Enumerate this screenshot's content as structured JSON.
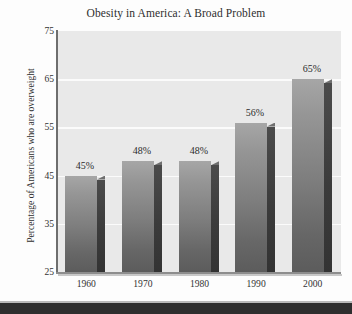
{
  "chart_data": {
    "type": "bar",
    "title": "Obesity in America: A Broad Problem",
    "xlabel": "",
    "ylabel": "Percentage of Americans who are overweight",
    "categories": [
      "1960",
      "1970",
      "1980",
      "1990",
      "2000"
    ],
    "values": [
      45,
      48,
      48,
      56,
      65
    ],
    "data_labels": [
      "45%",
      "48%",
      "48%",
      "56%",
      "65%"
    ],
    "ylim": [
      25,
      75
    ],
    "yticks": [
      75,
      65,
      55,
      45,
      35,
      25
    ],
    "ytick_labels": [
      "75",
      "65",
      "55",
      "45",
      "35",
      "25"
    ],
    "grid": true,
    "legend": false,
    "legend_position": "none",
    "series": [
      {
        "name": "Percentage overweight",
        "values": [
          45,
          48,
          48,
          56,
          65
        ]
      }
    ],
    "style": {
      "bar_color": "#7e7e7e",
      "bar_side_color": "#3b3b3b",
      "plot_background": "#e9e9e9",
      "gridline_color": "#fbfbfb",
      "axis_color": "#6e6e6e",
      "text_color": "#2e2e2e",
      "page_background": "#fdfdfd",
      "bottom_band_color": "#2e2e2e"
    }
  }
}
